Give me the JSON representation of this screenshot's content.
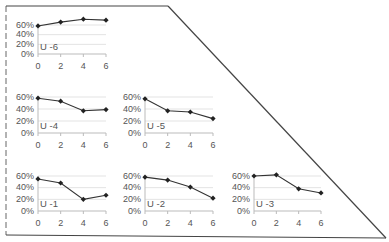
{
  "chart_data": [
    {
      "type": "line",
      "title": "U -6",
      "x": [
        0,
        2,
        4,
        6
      ],
      "values": [
        0.58,
        0.66,
        0.72,
        0.7
      ],
      "ylim": [
        0,
        0.6
      ],
      "yticks": [
        "60%",
        "40%",
        "20%",
        "0%"
      ],
      "xticks": [
        "0",
        "2",
        "4",
        "6"
      ]
    },
    {
      "type": "line",
      "title": "U -4",
      "x": [
        0,
        2,
        4,
        6
      ],
      "values": [
        0.58,
        0.53,
        0.37,
        0.39
      ],
      "ylim": [
        0,
        0.6
      ],
      "yticks": [
        "60%",
        "40%",
        "20%",
        "0%"
      ],
      "xticks": [
        "0",
        "2",
        "4",
        "6"
      ]
    },
    {
      "type": "line",
      "title": "U -5",
      "x": [
        0,
        2,
        4,
        6
      ],
      "values": [
        0.57,
        0.37,
        0.35,
        0.24
      ],
      "ylim": [
        0,
        0.6
      ],
      "yticks": [
        "60%",
        "40%",
        "20%",
        "0%"
      ],
      "xticks": [
        "0",
        "2",
        "4",
        "6"
      ]
    },
    {
      "type": "line",
      "title": "U -1",
      "x": [
        0,
        2,
        4,
        6
      ],
      "values": [
        0.55,
        0.48,
        0.2,
        0.27
      ],
      "ylim": [
        0,
        0.6
      ],
      "yticks": [
        "60%",
        "40%",
        "20%",
        "0%"
      ],
      "xticks": [
        "0",
        "2",
        "4",
        "6"
      ]
    },
    {
      "type": "line",
      "title": "U -2",
      "x": [
        0,
        2,
        4,
        6
      ],
      "values": [
        0.58,
        0.53,
        0.41,
        0.22
      ],
      "ylim": [
        0,
        0.6
      ],
      "yticks": [
        "60%",
        "40%",
        "20%",
        "0%"
      ],
      "xticks": [
        "0",
        "2",
        "4",
        "6"
      ]
    },
    {
      "type": "line",
      "title": "U -3",
      "x": [
        0,
        2,
        4,
        6
      ],
      "values": [
        0.6,
        0.62,
        0.38,
        0.31
      ],
      "ylim": [
        0,
        0.6
      ],
      "yticks": [
        "60%",
        "40%",
        "20%",
        "0%"
      ],
      "xticks": [
        "0",
        "2",
        "4",
        "6"
      ]
    }
  ],
  "panels": [
    {
      "label": "U -6",
      "y": [
        "60%",
        "40%",
        "20%",
        "0%"
      ],
      "x": [
        "0",
        "2",
        "4",
        "6"
      ]
    },
    {
      "label": "U -4",
      "y": [
        "60%",
        "40%",
        "20%",
        "0%"
      ],
      "x": [
        "0",
        "2",
        "4",
        "6"
      ]
    },
    {
      "label": "U -5",
      "y": [
        "60%",
        "40%",
        "20%",
        "0%"
      ],
      "x": [
        "0",
        "2",
        "4",
        "6"
      ]
    },
    {
      "label": "U -1",
      "y": [
        "60%",
        "40%",
        "20%",
        "0%"
      ],
      "x": [
        "0",
        "2",
        "4",
        "6"
      ]
    },
    {
      "label": "U -2",
      "y": [
        "60%",
        "40%",
        "20%",
        "0%"
      ],
      "x": [
        "0",
        "2",
        "4",
        "6"
      ]
    },
    {
      "label": "U -3",
      "y": [
        "60%",
        "40%",
        "20%",
        "0%"
      ],
      "x": [
        "0",
        "2",
        "4",
        "6"
      ]
    }
  ],
  "colors": {
    "line": "#333333",
    "marker": "#222222",
    "grid": "#e3e3e3",
    "axis": "#bbbbbb",
    "frame": "#444444"
  }
}
